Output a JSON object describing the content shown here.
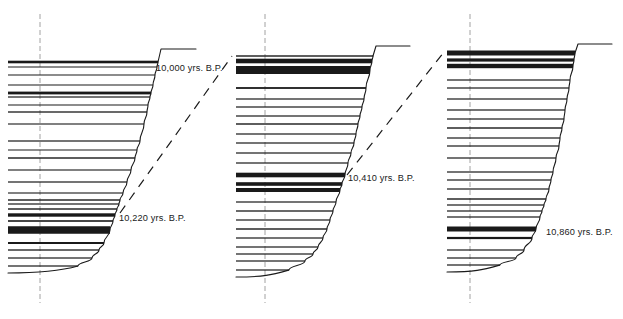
{
  "figure": {
    "type": "stratigraphic-correlation-diagram",
    "background_color": "#ffffff",
    "line_color": "#1a1a1a",
    "axis_color": "#8c8c8c",
    "width": 623,
    "height": 319
  },
  "labels": {
    "date_1": "10,000 yrs. B.P.",
    "date_2": "10,220 yrs. B.P.",
    "date_3": "10,410 yrs. B.P.",
    "date_4": "10,860 yrs. B.P."
  },
  "chart_data": {
    "type": "diagram",
    "xlabel": "",
    "ylabel": "",
    "grid": false,
    "legend_position": "none",
    "annotations": [
      {
        "text": "10,000 yrs. B.P.",
        "x": 156,
        "y": 71,
        "panel": 1
      },
      {
        "text": "10,220 yrs. B.P.",
        "x": 119,
        "y": 221,
        "panel": 1
      },
      {
        "text": "10,410 yrs. B.P.",
        "x": 348,
        "y": 181,
        "panel": 2
      },
      {
        "text": "10,860 yrs. B.P.",
        "x": 546,
        "y": 235,
        "panel": 3
      }
    ],
    "panels": [
      {
        "name": "panel-1",
        "center_axis_x": 40,
        "axis_top_y": 14,
        "axis_bottom_y": 303,
        "top_cap_y": 49,
        "top_cap_x_start": 161,
        "top_cap_x_end": 196,
        "left_x": 8,
        "laminae": [
          {
            "y": 62,
            "thickness": 2.6,
            "x_right": 158
          },
          {
            "y": 67,
            "thickness": 1.0,
            "x_right": 157
          },
          {
            "y": 75,
            "thickness": 1.0,
            "x_right": 155
          },
          {
            "y": 85,
            "thickness": 1.0,
            "x_right": 153
          },
          {
            "y": 93,
            "thickness": 2.8,
            "x_right": 151
          },
          {
            "y": 97,
            "thickness": 1.2,
            "x_right": 150
          },
          {
            "y": 105,
            "thickness": 1.0,
            "x_right": 148
          },
          {
            "y": 112,
            "thickness": 1.3,
            "x_right": 147
          },
          {
            "y": 124,
            "thickness": 1.1,
            "x_right": 144
          },
          {
            "y": 141,
            "thickness": 1.2,
            "x_right": 140
          },
          {
            "y": 150,
            "thickness": 1.0,
            "x_right": 137
          },
          {
            "y": 158,
            "thickness": 1.4,
            "x_right": 135
          },
          {
            "y": 170,
            "thickness": 1.1,
            "x_right": 131
          },
          {
            "y": 182,
            "thickness": 1.2,
            "x_right": 127
          },
          {
            "y": 193,
            "thickness": 1.1,
            "x_right": 123
          },
          {
            "y": 200,
            "thickness": 1.4,
            "x_right": 120
          },
          {
            "y": 204,
            "thickness": 1.2,
            "x_right": 119
          },
          {
            "y": 209,
            "thickness": 1.4,
            "x_right": 117
          },
          {
            "y": 215,
            "thickness": 3.4,
            "x_right": 115
          },
          {
            "y": 221,
            "thickness": 1.6,
            "x_right": 113
          },
          {
            "y": 230,
            "thickness": 7.5,
            "x_right": 110
          },
          {
            "y": 243,
            "thickness": 2.0,
            "x_right": 104
          },
          {
            "y": 250,
            "thickness": 1.3,
            "x_right": 99
          },
          {
            "y": 258,
            "thickness": 1.2,
            "x_right": 92
          },
          {
            "y": 266,
            "thickness": 1.2,
            "x_right": 78
          }
        ]
      },
      {
        "name": "panel-2",
        "center_axis_x": 265,
        "axis_top_y": 14,
        "axis_bottom_y": 303,
        "top_cap_y": 46,
        "top_cap_x_start": 376,
        "top_cap_x_end": 410,
        "left_x": 236,
        "laminae": [
          {
            "y": 56,
            "thickness": 1.4,
            "x_right": 373
          },
          {
            "y": 61,
            "thickness": 4.6,
            "x_right": 372
          },
          {
            "y": 70,
            "thickness": 8.0,
            "x_right": 370
          },
          {
            "y": 88,
            "thickness": 1.8,
            "x_right": 366
          },
          {
            "y": 99,
            "thickness": 1.2,
            "x_right": 364
          },
          {
            "y": 107,
            "thickness": 1.2,
            "x_right": 362
          },
          {
            "y": 116,
            "thickness": 1.2,
            "x_right": 360
          },
          {
            "y": 124,
            "thickness": 1.4,
            "x_right": 358
          },
          {
            "y": 134,
            "thickness": 1.2,
            "x_right": 356
          },
          {
            "y": 143,
            "thickness": 1.2,
            "x_right": 354
          },
          {
            "y": 153,
            "thickness": 1.2,
            "x_right": 351
          },
          {
            "y": 163,
            "thickness": 1.2,
            "x_right": 348
          },
          {
            "y": 175,
            "thickness": 4.6,
            "x_right": 345
          },
          {
            "y": 184,
            "thickness": 3.6,
            "x_right": 342
          },
          {
            "y": 190,
            "thickness": 4.0,
            "x_right": 340
          },
          {
            "y": 202,
            "thickness": 1.2,
            "x_right": 336
          },
          {
            "y": 211,
            "thickness": 1.3,
            "x_right": 333
          },
          {
            "y": 220,
            "thickness": 1.2,
            "x_right": 330
          },
          {
            "y": 229,
            "thickness": 1.4,
            "x_right": 327
          },
          {
            "y": 238,
            "thickness": 1.2,
            "x_right": 323
          },
          {
            "y": 247,
            "thickness": 1.2,
            "x_right": 318
          },
          {
            "y": 254,
            "thickness": 1.2,
            "x_right": 313
          },
          {
            "y": 261,
            "thickness": 1.2,
            "x_right": 305
          },
          {
            "y": 270,
            "thickness": 1.2,
            "x_right": 289
          }
        ]
      },
      {
        "name": "panel-3",
        "center_axis_x": 470,
        "axis_top_y": 14,
        "axis_bottom_y": 303,
        "top_cap_y": 44,
        "top_cap_x_start": 578,
        "top_cap_x_end": 612,
        "left_x": 447,
        "laminae": [
          {
            "y": 53,
            "thickness": 5.0,
            "x_right": 575
          },
          {
            "y": 60,
            "thickness": 3.2,
            "x_right": 574
          },
          {
            "y": 66,
            "thickness": 4.4,
            "x_right": 573
          },
          {
            "y": 80,
            "thickness": 1.2,
            "x_right": 570
          },
          {
            "y": 88,
            "thickness": 1.2,
            "x_right": 569
          },
          {
            "y": 99,
            "thickness": 1.2,
            "x_right": 567
          },
          {
            "y": 110,
            "thickness": 1.2,
            "x_right": 565
          },
          {
            "y": 119,
            "thickness": 1.2,
            "x_right": 564
          },
          {
            "y": 128,
            "thickness": 1.4,
            "x_right": 562
          },
          {
            "y": 138,
            "thickness": 1.2,
            "x_right": 560
          },
          {
            "y": 146,
            "thickness": 1.2,
            "x_right": 559
          },
          {
            "y": 158,
            "thickness": 1.2,
            "x_right": 556
          },
          {
            "y": 172,
            "thickness": 1.2,
            "x_right": 553
          },
          {
            "y": 180,
            "thickness": 1.2,
            "x_right": 551
          },
          {
            "y": 189,
            "thickness": 1.2,
            "x_right": 549
          },
          {
            "y": 199,
            "thickness": 1.4,
            "x_right": 546
          },
          {
            "y": 205,
            "thickness": 1.2,
            "x_right": 544
          },
          {
            "y": 211,
            "thickness": 1.2,
            "x_right": 542
          },
          {
            "y": 217,
            "thickness": 1.2,
            "x_right": 540
          },
          {
            "y": 229,
            "thickness": 5.0,
            "x_right": 536
          },
          {
            "y": 238,
            "thickness": 2.2,
            "x_right": 532
          },
          {
            "y": 250,
            "thickness": 1.2,
            "x_right": 524
          },
          {
            "y": 258,
            "thickness": 1.2,
            "x_right": 516
          },
          {
            "y": 265,
            "thickness": 1.2,
            "x_right": 500
          }
        ]
      }
    ],
    "correlation_lines": [
      {
        "name": "correlation-1-2",
        "x1": 120,
        "y1": 213,
        "x2": 232,
        "y2": 56,
        "style": "dashed"
      },
      {
        "name": "correlation-2-3",
        "x1": 347,
        "y1": 175,
        "x2": 444,
        "y2": 52,
        "style": "dashed"
      }
    ]
  }
}
